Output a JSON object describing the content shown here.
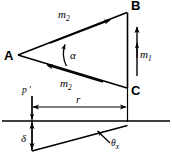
{
  "figure": {
    "background_color": "#ffffff",
    "line_color": "#000000",
    "width": 172,
    "height": 159
  },
  "vertices": {
    "a": {
      "label": "A",
      "x": 18,
      "y": 55
    },
    "b": {
      "label": "B",
      "x": 128,
      "y": 12
    },
    "c": {
      "label": "C",
      "x": 128,
      "y": 88
    }
  },
  "labels": {
    "m2_upper": {
      "base": "m",
      "sub": "2"
    },
    "m2_lower": {
      "base": "m",
      "sub": "2"
    },
    "m1": {
      "base": "m",
      "sub": "1"
    },
    "alpha": {
      "text": "α"
    },
    "delta": {
      "text": "δ"
    },
    "theta_x": {
      "base": "θ",
      "sub": "x"
    },
    "r": {
      "text": "r"
    },
    "p_prime": {
      "text": "p ′"
    }
  },
  "annotations": {
    "upper_arrow_direction": "toward-B",
    "lower_arrow_direction": "toward-A",
    "m1_arrow_type": "double-headed-vertical",
    "r_arrow_type": "double-headed-horizontal",
    "delta_arrow_type": "double-headed-vertical",
    "alpha_arc": "angle-at-A"
  },
  "reference_line": {
    "y": 121,
    "x_start": 0,
    "x_end": 172
  }
}
